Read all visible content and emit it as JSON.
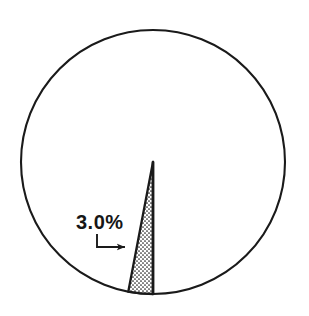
{
  "chart_data": {
    "type": "pie",
    "title": "",
    "subtitle": "",
    "xlabel": "",
    "ylabel": "",
    "grid": false,
    "legend_position": "none",
    "categories": [
      "Highlighted slice",
      "Remainder"
    ],
    "values": [
      3.0,
      97.0
    ],
    "units": "%",
    "annotations": [
      {
        "name": "slice-callout",
        "text": "3.0%",
        "target_slice_index": 0,
        "leader": "elbow-with-arrow",
        "arrow_direction": "right"
      }
    ],
    "slices": [
      {
        "label": "3.0%",
        "value": 3.0,
        "fill": "stipple-crosshatch",
        "stroke": "#1a1a1a",
        "start_angle_deg": 180.0,
        "end_angle_deg": 190.8,
        "labeled": true
      },
      {
        "label": "",
        "value": 97.0,
        "fill": "none",
        "stroke": "#1a1a1a",
        "start_angle_deg": 190.8,
        "end_angle_deg": 540.0,
        "labeled": false
      }
    ]
  },
  "figure": {
    "background_color": "#ffffff",
    "outline_color": "#1a1a1a",
    "label_color": "#161616",
    "circle": {
      "center_x": 153,
      "center_y": 162,
      "radius": 132
    }
  },
  "callout": {
    "label": "3.0%",
    "label_x": 76,
    "label_baseline_y": 229,
    "leader_start_x": 97,
    "leader_start_y": 235,
    "leader_corner_x": 97,
    "leader_corner_y": 247,
    "leader_end_x": 124,
    "leader_end_y": 247
  }
}
